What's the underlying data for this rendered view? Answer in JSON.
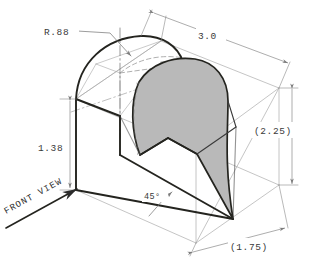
{
  "drawing": {
    "title": "Isometric pictorial sketch with sectioned cut",
    "background_color": "#ffffff",
    "ink_color": "#2b2b2b",
    "construction_line_color": "#9a9a9a",
    "section_fill_color": "#b9b9b9",
    "section_edge_color": "#2b2b2b"
  },
  "dimensions": [
    {
      "id": "radius",
      "label": "R.88",
      "kind": "radius-leader",
      "value": 0.88,
      "reference": false,
      "position": "upper-left"
    },
    {
      "id": "length",
      "label": "3.0",
      "kind": "linear",
      "value": 3.0,
      "reference": false,
      "position": "top"
    },
    {
      "id": "height-overall",
      "label": "(2.25)",
      "kind": "linear",
      "value": 2.25,
      "reference": true,
      "position": "right"
    },
    {
      "id": "height-base",
      "label": "1.38",
      "kind": "linear",
      "value": 1.38,
      "reference": false,
      "position": "left"
    },
    {
      "id": "depth",
      "label": "(1.75)",
      "kind": "linear",
      "value": 1.75,
      "reference": true,
      "position": "bottom-right"
    },
    {
      "id": "angle",
      "label": "45°",
      "kind": "angular",
      "value": 45,
      "reference": false,
      "position": "bottom-center"
    }
  ],
  "annotations": {
    "view_direction": {
      "label": "FRONT VIEW",
      "arrow": "up-right",
      "underlined": true
    }
  }
}
